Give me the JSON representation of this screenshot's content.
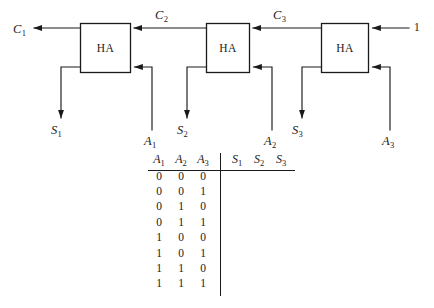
{
  "figure": {
    "type": "logic-circuit-with-truth-table",
    "ink_color": "#1a1a1a",
    "background_color": "#ffffff"
  },
  "circuit": {
    "block_label": "HA",
    "blocks": [
      {
        "id": "ha1",
        "label": "HA"
      },
      {
        "id": "ha2",
        "label": "HA"
      },
      {
        "id": "ha3",
        "label": "HA"
      }
    ],
    "carry_labels": [
      {
        "id": "c1",
        "base": "C",
        "sub": "1"
      },
      {
        "id": "c2",
        "base": "C",
        "sub": "2"
      },
      {
        "id": "c3",
        "base": "C",
        "sub": "3"
      }
    ],
    "sum_labels": [
      {
        "id": "s1",
        "base": "S",
        "sub": "1"
      },
      {
        "id": "s2",
        "base": "S",
        "sub": "2"
      },
      {
        "id": "s3",
        "base": "S",
        "sub": "3"
      }
    ],
    "input_labels": [
      {
        "id": "a1",
        "base": "A",
        "sub": "1"
      },
      {
        "id": "a2",
        "base": "A",
        "sub": "2"
      },
      {
        "id": "a3",
        "base": "A",
        "sub": "3"
      }
    ],
    "constant_input": "1"
  },
  "truth_table": {
    "input_headers": [
      {
        "base": "A",
        "sub": "1"
      },
      {
        "base": "A",
        "sub": "2"
      },
      {
        "base": "A",
        "sub": "3"
      }
    ],
    "output_headers": [
      {
        "base": "S",
        "sub": "1"
      },
      {
        "base": "S",
        "sub": "2"
      },
      {
        "base": "S",
        "sub": "3"
      }
    ],
    "rows": [
      {
        "inputs": [
          "0",
          "0",
          "0"
        ],
        "outputs": [
          "",
          "",
          ""
        ]
      },
      {
        "inputs": [
          "0",
          "0",
          "1"
        ],
        "outputs": [
          "",
          "",
          ""
        ]
      },
      {
        "inputs": [
          "0",
          "1",
          "0"
        ],
        "outputs": [
          "",
          "",
          ""
        ]
      },
      {
        "inputs": [
          "0",
          "1",
          "1"
        ],
        "outputs": [
          "",
          "",
          ""
        ]
      },
      {
        "inputs": [
          "1",
          "0",
          "0"
        ],
        "outputs": [
          "",
          "",
          ""
        ]
      },
      {
        "inputs": [
          "1",
          "0",
          "1"
        ],
        "outputs": [
          "",
          "",
          ""
        ]
      },
      {
        "inputs": [
          "1",
          "1",
          "0"
        ],
        "outputs": [
          "",
          "",
          ""
        ]
      },
      {
        "inputs": [
          "1",
          "1",
          "1"
        ],
        "outputs": [
          "",
          "",
          ""
        ]
      }
    ]
  }
}
